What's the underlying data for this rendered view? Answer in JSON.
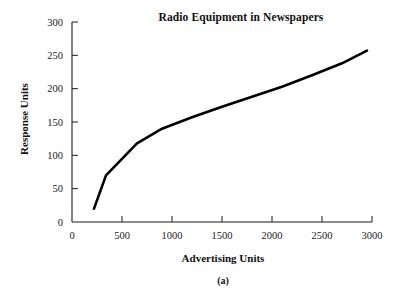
{
  "figure": {
    "caption": "(a)"
  },
  "chart_data": {
    "type": "line",
    "title": "Radio Equipment in Newspapers",
    "xlabel": "Advertising Units",
    "ylabel": "Response Units",
    "xlim": [
      0,
      3000
    ],
    "ylim": [
      0,
      300
    ],
    "xticks": [
      0,
      500,
      1000,
      1500,
      2000,
      2500,
      3000
    ],
    "yticks": [
      0,
      50,
      100,
      150,
      200,
      250,
      300
    ],
    "xtick_labels": [
      "0",
      "500",
      "1000",
      "1500",
      "2000",
      "2500",
      "3000"
    ],
    "ytick_labels": [
      "0",
      "50",
      "100",
      "150",
      "200",
      "250",
      "300"
    ],
    "grid": false,
    "legend": null,
    "series": [
      {
        "name": "Response",
        "color": "#000000",
        "x": [
          220,
          340,
          650,
          900,
          1200,
          1500,
          1800,
          2100,
          2400,
          2700,
          2950
        ],
        "y": [
          20,
          70,
          118,
          140,
          157,
          173,
          188,
          203,
          220,
          238,
          257
        ]
      }
    ]
  }
}
